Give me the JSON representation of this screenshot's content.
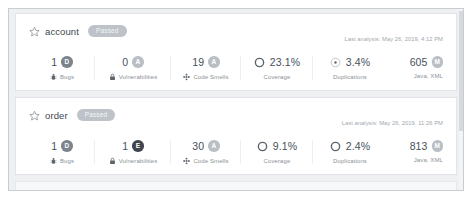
{
  "page": {
    "background_color": "#eef0f2",
    "card_background": "#ffffff",
    "border_color": "#e1e4e8"
  },
  "icons": {
    "star": "star-icon",
    "bug": "bug-icon",
    "vulnerability": "lock-icon",
    "code_smell": "code-smell-icon",
    "coverage_gauge": "coverage-donut-icon",
    "duplications_gauge": "duplications-donut-icon",
    "size_badge": "size-rating-icon"
  },
  "labels": {
    "bugs": "Bugs",
    "vulnerabilities": "Vulnerabilities",
    "code_smells": "Code Smells",
    "coverage": "Coverage",
    "duplications": "Duplications"
  },
  "rating_colors": {
    "A": "#b9bfc4",
    "D": "#7d848b",
    "E": "#3f464d"
  },
  "projects": [
    {
      "name": "account",
      "quality_gate": "Passed",
      "last_analysis": "Last analysis: May 26, 2019, 4:12 PM",
      "bugs": {
        "value": "1",
        "rating": "D"
      },
      "vulnerabilities": {
        "value": "0",
        "rating": "A"
      },
      "code_smells": {
        "value": "19",
        "rating": "A"
      },
      "coverage": {
        "value": "23.1%"
      },
      "duplications": {
        "value": "3.4%"
      },
      "lines_of_code": {
        "value": "605",
        "size_rating": "M",
        "languages": "Java, XML"
      }
    },
    {
      "name": "order",
      "quality_gate": "Passed",
      "last_analysis": "Last analysis: May 26, 2019, 11:26 PM",
      "bugs": {
        "value": "1",
        "rating": "D"
      },
      "vulnerabilities": {
        "value": "1",
        "rating": "E"
      },
      "code_smells": {
        "value": "30",
        "rating": "A"
      },
      "coverage": {
        "value": "9.1%"
      },
      "duplications": {
        "value": "2.4%"
      },
      "lines_of_code": {
        "value": "813",
        "size_rating": "M",
        "languages": "Java, XML"
      }
    }
  ]
}
